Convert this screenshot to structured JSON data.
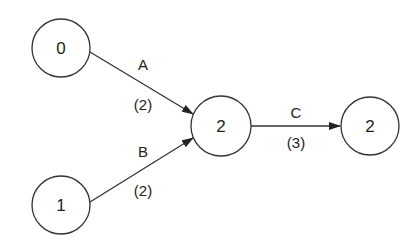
{
  "diagram": {
    "type": "directed-graph",
    "nodes": [
      {
        "id": "n0",
        "label": "0",
        "cx": 61,
        "cy": 48,
        "r": 29
      },
      {
        "id": "n1",
        "label": "1",
        "cx": 61,
        "cy": 205,
        "r": 29
      },
      {
        "id": "n2",
        "label": "2",
        "cx": 221,
        "cy": 125,
        "r": 30
      },
      {
        "id": "n3",
        "label": "2",
        "cx": 370,
        "cy": 125,
        "r": 29
      }
    ],
    "edges": [
      {
        "id": "A",
        "from": "n0",
        "to": "n2",
        "name": "A",
        "weight": "(2)"
      },
      {
        "id": "B",
        "from": "n1",
        "to": "n2",
        "name": "B",
        "weight": "(2)"
      },
      {
        "id": "C",
        "from": "n2",
        "to": "n3",
        "name": "C",
        "weight": "(3)"
      }
    ],
    "colors": {
      "stroke": "#333333",
      "text": "#222222",
      "background": "#ffffff"
    }
  }
}
